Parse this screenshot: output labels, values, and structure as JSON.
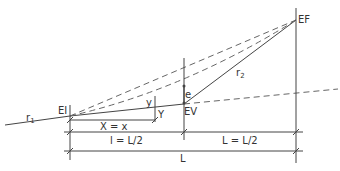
{
  "colors": {
    "line": "#444444",
    "dashed": "#666666",
    "text": "#333333"
  },
  "points": {
    "EI": {
      "label": "EI"
    },
    "EV": {
      "label": "EV"
    },
    "EF": {
      "label": "EF"
    },
    "Y": {
      "label": "Y"
    }
  },
  "labels": {
    "r1": "r",
    "r1_sub": "1",
    "r2": "r",
    "r2_sub": "2",
    "y": "y",
    "e": "e"
  },
  "dimensions": {
    "X": "X = x",
    "l": "l = L/2",
    "L_half": "L = L/2",
    "L": "L"
  }
}
